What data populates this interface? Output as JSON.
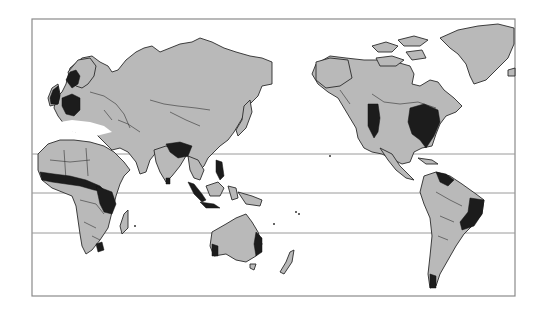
{
  "map": {
    "projection": "world map, Pacific-centered (Europe/Africa left, Americas right)",
    "colors": {
      "background": "#ffffff",
      "land": "#b9b9b9",
      "highlighted": "#1c1c1c",
      "frame": "#8a8a8a",
      "latitude_lines": "#9a9a9a"
    },
    "frame": {
      "x": 32,
      "y": 19,
      "width": 483,
      "height": 277
    },
    "latitude_lines_y": [
      154,
      193,
      233
    ],
    "legend": null,
    "highlighted_regions": [
      "Norway/Scandinavia (southwest)",
      "United Kingdom",
      "Germany / Central Europe",
      "West African coast (Guinea Coast to Nigeria)",
      "Central Africa (Congo basin / DR Congo)",
      "South Africa (southeast)",
      "Northern India / Ganges region",
      "Sri Lanka",
      "Sumatra / Java",
      "Philippines (parts)",
      "Eastern Australia",
      "Southwestern Australia",
      "Western United States (California/Pacific)",
      "Eastern United States",
      "Northern South America (Venezuela/Guianas)",
      "Eastern Brazil",
      "Southern Chile"
    ]
  }
}
